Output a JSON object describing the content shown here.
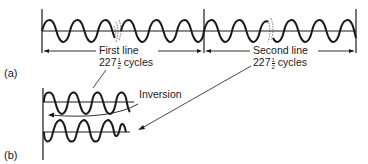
{
  "figure": {
    "panel_a": {
      "label": "(a)",
      "first_line": {
        "title": "First line",
        "cycles_int": "227",
        "cycles_num": "1",
        "cycles_den": "2",
        "cycles_unit": "cycles"
      },
      "second_line": {
        "title": "Second line",
        "cycles_int": "227",
        "cycles_num": "1",
        "cycles_den": "2",
        "cycles_unit": "cycles"
      }
    },
    "panel_b": {
      "label": "(b)",
      "annotation": "Inversion"
    },
    "colors": {
      "ink": "#1a1a1a",
      "background": "#ffffff"
    }
  }
}
